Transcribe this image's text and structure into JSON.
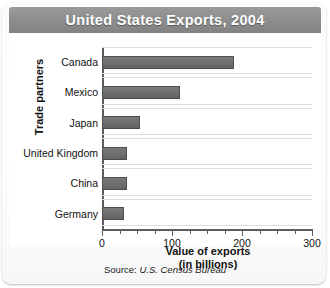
{
  "title": "United States Exports, 2004",
  "source_note": {
    "prefix": "Source:",
    "text": "U.S. Census Bureau"
  },
  "colors": {
    "title_bar": "#8d8d8d",
    "title_text": "#ffffff",
    "bar": "#6e6e6e",
    "bar_outline": "#4e4e4e",
    "gridline": "#dcdcdc",
    "axis": "#5d5d5d",
    "plot_background": "#ffffff"
  },
  "chart_data": {
    "type": "bar",
    "orientation": "horizontal",
    "title": "United States Exports, 2004",
    "categories": [
      "Canada",
      "Mexico",
      "Japan",
      "United Kingdom",
      "China",
      "Germany"
    ],
    "values": [
      189,
      111,
      54,
      36,
      35,
      32
    ],
    "xlabel": "Value of exports\n(in billions)",
    "xlabel_line1": "Value of exports",
    "xlabel_line2": "(in billions)",
    "ylabel": "Trade partners",
    "xlim": [
      0,
      300
    ],
    "xticks": [
      0,
      100,
      200,
      300
    ],
    "xtick_labels": [
      "0",
      "100",
      "200",
      "300"
    ],
    "minor_tick_interval": 25,
    "grid": true,
    "grid_axis": "y",
    "legend": false,
    "units": "billions of US dollars",
    "source": "U.S. Census Bureau"
  }
}
